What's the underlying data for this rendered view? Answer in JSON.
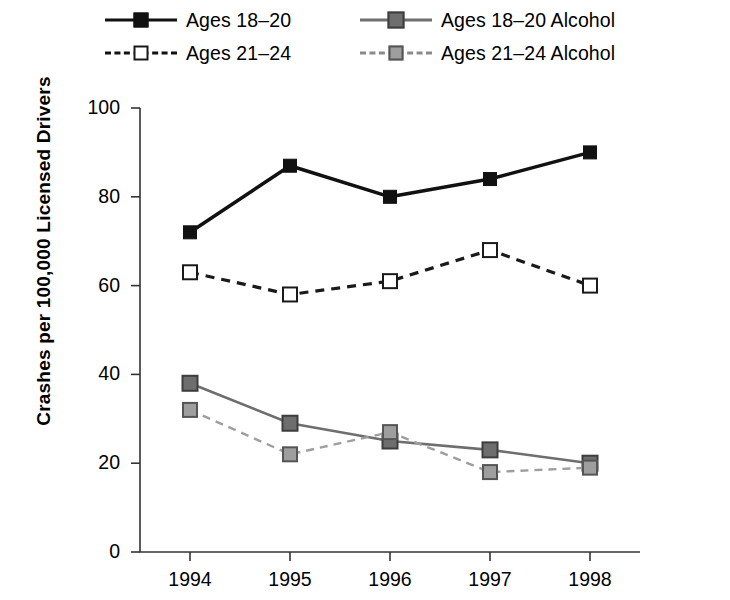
{
  "chart_data": {
    "type": "line",
    "title": "",
    "xlabel": "",
    "ylabel": "Crashes per 100,000 Licensed Drivers",
    "categories": [
      "1994",
      "1995",
      "1996",
      "1997",
      "1998"
    ],
    "ylim": [
      0,
      100
    ],
    "yticks": [
      0,
      20,
      40,
      60,
      80,
      100
    ],
    "ytick_labels": [
      "0",
      "20",
      "40",
      "60",
      "80",
      "100"
    ],
    "grid": false,
    "legend_position": "top",
    "series": [
      {
        "name": "Ages 18–20",
        "values": [
          72,
          87,
          80,
          84,
          90
        ],
        "color": "#111111",
        "line_style": "solid",
        "marker": "filled-square"
      },
      {
        "name": "Ages 21–24",
        "values": [
          63,
          58,
          61,
          68,
          60
        ],
        "color": "#1a1a1a",
        "line_style": "dashed",
        "marker": "open-square"
      },
      {
        "name": "Ages 18–20 Alcohol",
        "values": [
          38,
          29,
          25,
          23,
          20
        ],
        "color": "#6e6e6e",
        "line_style": "solid",
        "marker": "gray-square"
      },
      {
        "name": "Ages 21–24 Alcohol",
        "values": [
          32,
          22,
          27,
          18,
          19
        ],
        "color": "#9e9e9e",
        "line_style": "dashed",
        "marker": "light-gray-square"
      }
    ]
  },
  "legend": {
    "items": [
      {
        "label": "Ages 18–20",
        "marker": "filled-square",
        "line_style": "solid"
      },
      {
        "label": "Ages 18–20 Alcohol",
        "marker": "gray-square",
        "line_style": "solid"
      },
      {
        "label": "Ages 21–24",
        "marker": "open-square",
        "line_style": "dashed"
      },
      {
        "label": "Ages 21–24 Alcohol",
        "marker": "light-gray-square",
        "line_style": "dashed"
      }
    ]
  },
  "axis": {
    "y_title": "Crashes per 100,000 Licensed Drivers"
  }
}
